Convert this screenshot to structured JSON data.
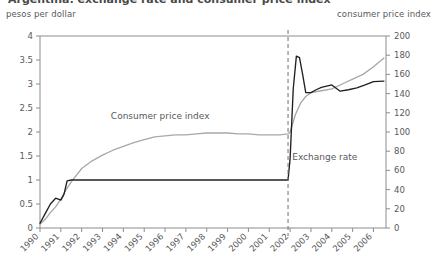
{
  "title_fragment": "Argentina: exchange rate and consumer price index",
  "left_axis_title": "pesos per dollar",
  "right_axis_title": "consumer price index",
  "series_labels": {
    "cpi": "Consumer price index",
    "fx": "Exchange rate"
  },
  "colors": {
    "cpi_line": "#a8a8a8",
    "fx_line": "#231f20",
    "axis": "#8c8c8c",
    "text": "#58595b",
    "divider": "#6f6f6f"
  },
  "chart_data": {
    "type": "line",
    "title": "Argentina: exchange rate and consumer price index",
    "xlabel": "",
    "ylabel": "pesos per dollar",
    "y2label": "consumer price index",
    "xlim": [
      1990,
      2006.6
    ],
    "ylim": [
      0,
      4
    ],
    "y2lim": [
      0,
      200
    ],
    "grid": false,
    "legend": "inline-annotations",
    "xticks": [
      "1990",
      "1991",
      "1992",
      "1993",
      "1994",
      "1995",
      "1996",
      "1997",
      "1998",
      "1999",
      "2000",
      "2001",
      "2002",
      "2003",
      "2004",
      "2005",
      "2006"
    ],
    "yticks_left": [
      "0",
      "0.5",
      "1",
      "1.5",
      "2",
      "2.5",
      "3",
      "3.5",
      "4"
    ],
    "yticks_right": [
      "0",
      "20",
      "40",
      "60",
      "80",
      "100",
      "120",
      "140",
      "160",
      "180",
      "200"
    ],
    "annotations": [
      {
        "text": "Consumer price index",
        "x": 1993.4,
        "y": 2.28
      },
      {
        "text": "Exchange rate",
        "x": 2002.1,
        "y": 1.42
      },
      {
        "text": "convertibility ends",
        "x": 2001.9,
        "type": "vertical-dashed-line"
      }
    ],
    "series": [
      {
        "name": "Consumer price index",
        "axis": "right",
        "unit": "index (1999=100)",
        "x": [
          1990.0,
          1990.25,
          1990.5,
          1990.75,
          1991.0,
          1991.25,
          1991.5,
          1991.75,
          1992.0,
          1992.5,
          1993.0,
          1993.5,
          1994.0,
          1994.5,
          1995.0,
          1995.5,
          1996.0,
          1996.5,
          1997.0,
          1997.5,
          1998.0,
          1998.5,
          1999.0,
          1999.5,
          2000.0,
          2000.5,
          2001.0,
          2001.5,
          2001.9,
          2002.0,
          2002.25,
          2002.5,
          2002.75,
          2003.0,
          2003.5,
          2004.0,
          2004.5,
          2005.0,
          2005.5,
          2006.0,
          2006.5
        ],
        "values": [
          4,
          9,
          16,
          22,
          30,
          40,
          48,
          55,
          62,
          70,
          76,
          81,
          85,
          89,
          92,
          95,
          96,
          97,
          97,
          98,
          99,
          99,
          99,
          98,
          98,
          97,
          97,
          97,
          98,
          100,
          118,
          130,
          137,
          141,
          143,
          145,
          150,
          155,
          160,
          168,
          177
        ]
      },
      {
        "name": "Exchange rate",
        "axis": "left",
        "unit": "pesos per dollar",
        "x": [
          1990.0,
          1990.25,
          1990.5,
          1990.75,
          1991.0,
          1991.15,
          1991.3,
          1991.5,
          1991.75,
          1992.0,
          1993.0,
          1994.0,
          1995.0,
          1996.0,
          1997.0,
          1998.0,
          1999.0,
          2000.0,
          2001.0,
          2001.75,
          2001.9,
          2002.0,
          2002.15,
          2002.3,
          2002.45,
          2002.6,
          2002.75,
          2003.0,
          2003.25,
          2003.5,
          2004.0,
          2004.4,
          2004.8,
          2005.2,
          2005.6,
          2006.0,
          2006.5
        ],
        "values": [
          0.1,
          0.3,
          0.5,
          0.62,
          0.58,
          0.7,
          0.98,
          1.0,
          1.0,
          1.0,
          1.0,
          1.0,
          1.0,
          1.0,
          1.0,
          1.0,
          1.0,
          1.0,
          1.0,
          1.0,
          1.0,
          1.45,
          2.9,
          3.58,
          3.55,
          3.2,
          2.82,
          2.82,
          2.88,
          2.93,
          2.98,
          2.85,
          2.88,
          2.92,
          2.98,
          3.05,
          3.06
        ]
      }
    ]
  }
}
